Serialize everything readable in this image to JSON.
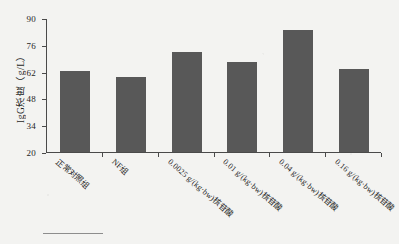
{
  "chart_data": {
    "type": "bar",
    "title": "",
    "xlabel": "",
    "ylabel": "IgG浓度（g/L）",
    "ylim": [
      20,
      90
    ],
    "yticks": [
      20,
      34,
      48,
      62,
      76,
      90
    ],
    "grid": false,
    "legend": "none",
    "bar_color": "#585858",
    "axis_color": "#4a4a4a",
    "categories": [
      "正常对照组",
      "NF组",
      "0.0025 g/(kg·bw)核苷酸",
      "0.01 g/(kg·bw)核苷酸",
      "0.04 g/(kg·bw)核苷酸",
      "0.16 g/(kg·bw)核苷酸"
    ],
    "values": [
      62.3,
      59.0,
      72.0,
      67.0,
      84.0,
      63.3
    ],
    "ytick_labels": [
      "20",
      "34",
      "48",
      "62",
      "76",
      "90"
    ]
  },
  "figure": {
    "background": "#f3f3f1",
    "has_footer_rule": true
  }
}
